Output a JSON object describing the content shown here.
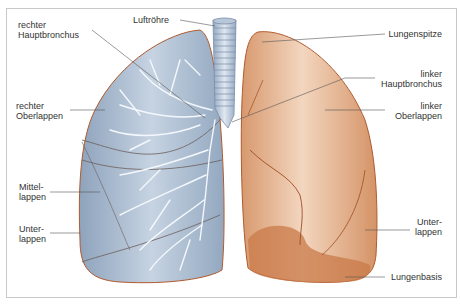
{
  "diagram": {
    "title": "Lunge",
    "colors": {
      "right_lung": "#9fb2c8",
      "right_lung_outline": "#b05a2e",
      "left_lung": "#d9a07a",
      "left_lung_outline": "#b05a2e",
      "trachea": "#c5d3e2",
      "leader_line": "#555555",
      "border": "#c8c8c8"
    },
    "labels": {
      "trachea": "Luftröhre",
      "right_main_bronchus_1": "rechter",
      "right_main_bronchus_2": "Hauptbronchus",
      "right_upper_lobe_1": "rechter",
      "right_upper_lobe_2": "Oberlappen",
      "middle_lobe_1": "Mittel-",
      "middle_lobe_2": "lappen",
      "right_lower_lobe_1": "Unter-",
      "right_lower_lobe_2": "lappen",
      "apex": "Lungenspitze",
      "left_main_bronchus_1": "linker",
      "left_main_bronchus_2": "Hauptbronchus",
      "left_upper_lobe_1": "linker",
      "left_upper_lobe_2": "Oberlappen",
      "left_lower_lobe_1": "Unter-",
      "left_lower_lobe_2": "lappen",
      "base": "Lungenbasis"
    }
  }
}
